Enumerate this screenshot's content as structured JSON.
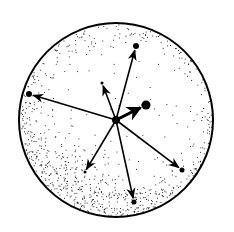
{
  "diagram": {
    "type": "vector-sphere",
    "sphere": {
      "cx": 116,
      "cy": 120,
      "r": 97,
      "stroke": "#000000",
      "fill": "#ffffff"
    },
    "center": {
      "x": 116,
      "y": 120,
      "r": 4
    },
    "vectors": [
      {
        "id": "up-right",
        "x": 136,
        "y": 46,
        "dot_r": 3
      },
      {
        "id": "left",
        "x": 29,
        "y": 94,
        "dot_r": 3
      },
      {
        "id": "up-short",
        "x": 102,
        "y": 83,
        "dot_r": 1.5
      },
      {
        "id": "short-bold",
        "x": 146,
        "y": 105,
        "dot_r": 4.5,
        "bold": true
      },
      {
        "id": "down-right",
        "x": 182,
        "y": 170,
        "dot_r": 2.5
      },
      {
        "id": "down",
        "x": 134,
        "y": 202,
        "dot_r": 2.5
      },
      {
        "id": "down-left",
        "x": 85,
        "y": 172,
        "dot_r": 1.5
      }
    ]
  }
}
